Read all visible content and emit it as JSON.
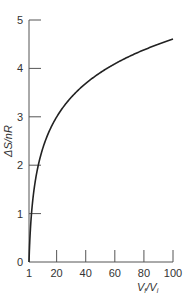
{
  "chart_data": {
    "type": "line",
    "title": "",
    "xlabel": "V_f/V_i",
    "ylabel": "ΔS/nR",
    "xlim": [
      1,
      100
    ],
    "ylim": [
      0,
      5
    ],
    "x_ticks": [
      1,
      20,
      40,
      60,
      80,
      100
    ],
    "y_ticks": [
      0,
      1,
      2,
      3,
      4,
      5
    ],
    "grid": false,
    "legend": "none",
    "series": [
      {
        "name": "ΔS/nR = ln(Vf/Vi)",
        "x": [
          1,
          2,
          3,
          5,
          10,
          20,
          30,
          40,
          50,
          60,
          70,
          80,
          90,
          100
        ],
        "values": [
          0,
          0.69,
          1.1,
          1.61,
          2.3,
          3.0,
          3.4,
          3.69,
          3.91,
          4.09,
          4.25,
          4.38,
          4.5,
          4.61
        ]
      }
    ]
  },
  "labels": {
    "xlabel_main": "V",
    "xlabel_sub1": "f",
    "xlabel_slash": "/V",
    "xlabel_sub2": "i",
    "ylabel": "ΔS/nR"
  },
  "colors": {
    "curve": "#222222",
    "axis": "#555555"
  }
}
